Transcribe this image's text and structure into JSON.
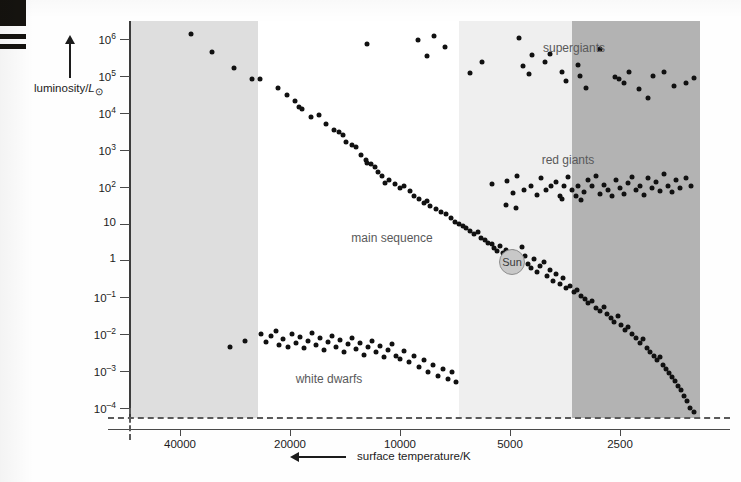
{
  "figure": {
    "type": "hr-diagram",
    "width": 741,
    "height": 482
  },
  "axes": {
    "y": {
      "title_prefix": "luminosity/",
      "title_symbol": "L",
      "title_subscript": "⊙",
      "title_full": "luminosity/L⊙",
      "arrow": "up-arrow-icon",
      "scale": "log",
      "ticks": [
        {
          "label": "10",
          "exp": "6",
          "value": 1000000
        },
        {
          "label": "10",
          "exp": "5",
          "value": 100000
        },
        {
          "label": "10",
          "exp": "4",
          "value": 10000
        },
        {
          "label": "10",
          "exp": "3",
          "value": 1000
        },
        {
          "label": "10",
          "exp": "2",
          "value": 100
        },
        {
          "label": "10",
          "exp": "",
          "value": 10
        },
        {
          "label": "1",
          "exp": "",
          "value": 1
        },
        {
          "label": "10",
          "exp": "–1",
          "value": 0.1
        },
        {
          "label": "10",
          "exp": "–2",
          "value": 0.01
        },
        {
          "label": "10",
          "exp": "–3",
          "value": 0.001
        },
        {
          "label": "10",
          "exp": "–4",
          "value": 0.0001
        }
      ]
    },
    "x": {
      "title": "surface temperature/K",
      "arrow": "left-arrow-icon",
      "scale": "log-reversed",
      "ticks": [
        {
          "label": "40000",
          "value": 40000
        },
        {
          "label": "20000",
          "value": 20000
        },
        {
          "label": "10000",
          "value": 10000
        },
        {
          "label": "5000",
          "value": 5000
        },
        {
          "label": "2500",
          "value": 2500
        }
      ]
    }
  },
  "bands": [
    {
      "name": "band-blue-white",
      "color": "#dedede",
      "x0": 0,
      "x1": 128
    },
    {
      "name": "band-white",
      "color": "#ffffff",
      "x0": 128,
      "x1": 329
    },
    {
      "name": "band-yellow-white",
      "color": "#efefef",
      "x0": 329,
      "x1": 442
    },
    {
      "name": "band-orange-red",
      "color": "#b3b3b3",
      "x0": 442,
      "x1": 570
    }
  ],
  "region_labels": [
    {
      "name": "supergiants-label",
      "text": "supergiants",
      "x": 574,
      "y": 41
    },
    {
      "name": "red-giants-label",
      "text": "red giants",
      "x": 568,
      "y": 153
    },
    {
      "name": "main-sequence-label",
      "text": "main sequence",
      "x": 392,
      "y": 231
    },
    {
      "name": "white-dwarfs-label",
      "text": "white dwarfs",
      "x": 329,
      "y": 372
    }
  ],
  "sun": {
    "label": "Sun",
    "x": 512,
    "y": 262,
    "fill": "#c8c8c8",
    "stroke": "#8e8e8e"
  },
  "colors": {
    "point": "#111111",
    "axis": "#4a4a4a",
    "text": "#1c1c1c",
    "label": "#59595a",
    "background": "#ffffff"
  },
  "chart_data": {
    "type": "scatter",
    "title": "",
    "xlabel": "surface temperature/K",
    "ylabel": "luminosity/L⊙",
    "xscale": "log",
    "yscale": "log",
    "x_reversed": true,
    "xlim": [
      52000,
      2100
    ],
    "ylim": [
      5e-05,
      3000000
    ],
    "grid": false,
    "legend": "none",
    "annotations": [
      "supergiants",
      "red giants",
      "main sequence",
      "white dwarfs",
      "Sun"
    ],
    "series": [
      {
        "name": "main sequence",
        "points_px": [
          [
            191,
            34
          ],
          [
            212,
            52
          ],
          [
            234,
            68
          ],
          [
            252,
            79
          ],
          [
            260,
            79
          ],
          [
            278,
            88
          ],
          [
            287,
            95
          ],
          [
            295,
            101
          ],
          [
            299,
            107
          ],
          [
            302,
            109
          ],
          [
            311,
            117
          ],
          [
            319,
            115
          ],
          [
            326,
            124
          ],
          [
            334,
            130
          ],
          [
            339,
            132
          ],
          [
            343,
            135
          ],
          [
            346,
            142
          ],
          [
            352,
            145
          ],
          [
            356,
            147
          ],
          [
            361,
            155
          ],
          [
            366,
            160
          ],
          [
            367,
            163
          ],
          [
            371,
            164
          ],
          [
            375,
            167
          ],
          [
            378,
            172
          ],
          [
            382,
            176
          ],
          [
            385,
            183
          ],
          [
            389,
            180
          ],
          [
            395,
            184
          ],
          [
            400,
            188
          ],
          [
            404,
            186
          ],
          [
            410,
            191
          ],
          [
            414,
            196
          ],
          [
            419,
            199
          ],
          [
            424,
            203
          ],
          [
            427,
            201
          ],
          [
            430,
            206
          ],
          [
            436,
            209
          ],
          [
            441,
            212
          ],
          [
            446,
            214
          ],
          [
            451,
            218
          ],
          [
            455,
            222
          ],
          [
            459,
            224
          ],
          [
            463,
            226
          ],
          [
            466,
            228
          ],
          [
            470,
            231
          ],
          [
            474,
            234
          ],
          [
            478,
            232
          ],
          [
            481,
            238
          ],
          [
            485,
            240
          ],
          [
            488,
            243
          ],
          [
            492,
            244
          ],
          [
            494,
            248
          ],
          [
            497,
            251
          ],
          [
            500,
            246
          ],
          [
            503,
            253
          ],
          [
            506,
            250
          ],
          [
            510,
            256
          ],
          [
            513,
            252
          ],
          [
            516,
            258
          ],
          [
            519,
            262
          ],
          [
            522,
            247
          ],
          [
            525,
            256
          ],
          [
            528,
            264
          ],
          [
            531,
            268
          ],
          [
            534,
            259
          ],
          [
            537,
            272
          ],
          [
            540,
            266
          ],
          [
            544,
            262
          ],
          [
            547,
            276
          ],
          [
            550,
            270
          ],
          [
            553,
            281
          ],
          [
            556,
            274
          ],
          [
            560,
            284
          ],
          [
            563,
            278
          ],
          [
            566,
            288
          ],
          [
            570,
            286
          ],
          [
            574,
            292
          ],
          [
            577,
            290
          ],
          [
            581,
            296
          ],
          [
            585,
            299
          ],
          [
            588,
            303
          ],
          [
            592,
            301
          ],
          [
            596,
            308
          ],
          [
            600,
            311
          ],
          [
            604,
            307
          ],
          [
            607,
            314
          ],
          [
            611,
            318
          ],
          [
            614,
            322
          ],
          [
            618,
            316
          ],
          [
            621,
            325
          ],
          [
            625,
            330
          ],
          [
            628,
            327
          ],
          [
            632,
            334
          ],
          [
            636,
            338
          ],
          [
            640,
            343
          ],
          [
            643,
            339
          ],
          [
            647,
            348
          ],
          [
            650,
            352
          ],
          [
            654,
            356
          ],
          [
            657,
            360
          ],
          [
            660,
            357
          ],
          [
            663,
            365
          ],
          [
            666,
            369
          ],
          [
            669,
            373
          ],
          [
            672,
            377
          ],
          [
            675,
            381
          ],
          [
            678,
            386
          ],
          [
            681,
            390
          ],
          [
            684,
            396
          ],
          [
            687,
            401
          ],
          [
            690,
            408
          ],
          [
            694,
            412
          ]
        ]
      },
      {
        "name": "supergiants",
        "points_px": [
          [
            367,
            44
          ],
          [
            418,
            40
          ],
          [
            427,
            56
          ],
          [
            434,
            36
          ],
          [
            445,
            47
          ],
          [
            470,
            73
          ],
          [
            482,
            62
          ],
          [
            519,
            38
          ],
          [
            523,
            66
          ],
          [
            529,
            74
          ],
          [
            532,
            55
          ],
          [
            545,
            62
          ],
          [
            550,
            54
          ],
          [
            562,
            72
          ],
          [
            566,
            81
          ],
          [
            578,
            65
          ],
          [
            580,
            76
          ],
          [
            586,
            88
          ],
          [
            600,
            49
          ],
          [
            615,
            77
          ],
          [
            619,
            79
          ],
          [
            624,
            83
          ],
          [
            629,
            72
          ],
          [
            639,
            89
          ],
          [
            648,
            98
          ],
          [
            653,
            76
          ],
          [
            664,
            72
          ],
          [
            674,
            86
          ],
          [
            686,
            83
          ],
          [
            694,
            78
          ]
        ]
      },
      {
        "name": "red giants",
        "points_px": [
          [
            492,
            184
          ],
          [
            507,
            181
          ],
          [
            513,
            193
          ],
          [
            517,
            176
          ],
          [
            524,
            190
          ],
          [
            531,
            186
          ],
          [
            537,
            195
          ],
          [
            541,
            178
          ],
          [
            546,
            190
          ],
          [
            551,
            186
          ],
          [
            556,
            182
          ],
          [
            560,
            196
          ],
          [
            564,
            186
          ],
          [
            568,
            177
          ],
          [
            572,
            190
          ],
          [
            576,
            196
          ],
          [
            578,
            186
          ],
          [
            581,
            200
          ],
          [
            584,
            192
          ],
          [
            588,
            180
          ],
          [
            592,
            186
          ],
          [
            596,
            176
          ],
          [
            600,
            194
          ],
          [
            604,
            185
          ],
          [
            608,
            190
          ],
          [
            612,
            196
          ],
          [
            616,
            180
          ],
          [
            620,
            188
          ],
          [
            624,
            194
          ],
          [
            628,
            183
          ],
          [
            632,
            177
          ],
          [
            636,
            190
          ],
          [
            640,
            186
          ],
          [
            644,
            195
          ],
          [
            648,
            178
          ],
          [
            652,
            188
          ],
          [
            656,
            182
          ],
          [
            660,
            191
          ],
          [
            664,
            174
          ],
          [
            668,
            186
          ],
          [
            672,
            192
          ],
          [
            676,
            180
          ],
          [
            680,
            188
          ],
          [
            686,
            178
          ],
          [
            691,
            186
          ],
          [
            506,
            205
          ],
          [
            516,
            208
          ],
          [
            562,
            199
          ]
        ]
      },
      {
        "name": "white dwarfs",
        "points_px": [
          [
            245,
            341
          ],
          [
            261,
            334
          ],
          [
            266,
            342
          ],
          [
            271,
            336
          ],
          [
            276,
            331
          ],
          [
            279,
            345
          ],
          [
            283,
            339
          ],
          [
            288,
            347
          ],
          [
            292,
            334
          ],
          [
            296,
            343
          ],
          [
            300,
            337
          ],
          [
            304,
            348
          ],
          [
            308,
            341
          ],
          [
            312,
            333
          ],
          [
            316,
            345
          ],
          [
            320,
            338
          ],
          [
            324,
            350
          ],
          [
            328,
            342
          ],
          [
            332,
            336
          ],
          [
            336,
            347
          ],
          [
            340,
            340
          ],
          [
            344,
            352
          ],
          [
            348,
            344
          ],
          [
            352,
            338
          ],
          [
            356,
            349
          ],
          [
            360,
            343
          ],
          [
            364,
            355
          ],
          [
            368,
            347
          ],
          [
            372,
            341
          ],
          [
            376,
            352
          ],
          [
            380,
            346
          ],
          [
            384,
            357
          ],
          [
            388,
            350
          ],
          [
            392,
            344
          ],
          [
            396,
            356
          ],
          [
            400,
            359
          ],
          [
            404,
            351
          ],
          [
            409,
            362
          ],
          [
            414,
            356
          ],
          [
            419,
            367
          ],
          [
            424,
            360
          ],
          [
            428,
            372
          ],
          [
            433,
            365
          ],
          [
            438,
            376
          ],
          [
            443,
            369
          ],
          [
            448,
            379
          ],
          [
            452,
            372
          ],
          [
            456,
            382
          ],
          [
            230,
            347
          ]
        ]
      }
    ]
  }
}
